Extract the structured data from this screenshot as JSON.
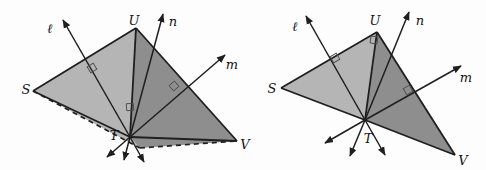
{
  "canvas": {
    "width": 486,
    "height": 170,
    "background": "#fdfdfd"
  },
  "colors": {
    "light_fill": "#b5b5b5",
    "dark_fill": "#8e8e8e",
    "stroke": "#1f1f1f",
    "label": "#131313",
    "angle_mark": "#4a4a4a"
  },
  "figures": [
    {
      "id": "left-figure",
      "vertices": {
        "S": [
          33,
          91
        ],
        "U": [
          136,
          28
        ],
        "T": [
          130,
          137
        ],
        "V": [
          237,
          141
        ],
        "P": [
          140,
          148
        ]
      },
      "light_face": [
        "S",
        "U",
        "T",
        "P"
      ],
      "dark_face": [
        "U",
        "V",
        "P",
        "T"
      ],
      "solid_edges": [
        [
          "S",
          "U"
        ],
        [
          "U",
          "V"
        ],
        [
          "U",
          "T"
        ],
        [
          "S",
          "T"
        ],
        [
          "T",
          "V"
        ]
      ],
      "dashed_edges": [
        [
          "S",
          "P"
        ],
        [
          "P",
          "V"
        ]
      ],
      "rays": [
        {
          "name": "ray-l-up",
          "from": "T",
          "to": [
            63,
            20
          ]
        },
        {
          "name": "ray-l-down",
          "from": "T",
          "to": [
            144,
            162
          ]
        },
        {
          "name": "ray-n-up",
          "from": "T",
          "to": [
            163,
            14
          ]
        },
        {
          "name": "ray-n-down",
          "from": "T",
          "to": [
            124,
            160
          ]
        },
        {
          "name": "ray-m-up",
          "from": "T",
          "to": [
            225,
            55
          ]
        },
        {
          "name": "ray-m-down",
          "from": "T",
          "to": [
            107,
            157
          ]
        }
      ],
      "right_angle_marks": [
        {
          "x": 92,
          "y": 68,
          "rotation": -31,
          "size": 7
        },
        {
          "x": 174,
          "y": 86,
          "rotation": -41,
          "size": 7
        },
        {
          "x": 130,
          "y": 107,
          "rotation": -3,
          "size": 7
        }
      ],
      "labels": [
        {
          "name": "label-line-l",
          "text": "ℓ",
          "x": 50,
          "y": 28
        },
        {
          "name": "label-vertex-U",
          "text": "U",
          "x": 134,
          "y": 20
        },
        {
          "name": "label-line-n",
          "text": "n",
          "x": 173,
          "y": 21
        },
        {
          "name": "label-line-m",
          "text": "m",
          "x": 232,
          "y": 64
        },
        {
          "name": "label-vertex-S",
          "text": "S",
          "x": 26,
          "y": 89
        },
        {
          "name": "label-vertex-T",
          "text": "T",
          "x": 114,
          "y": 135
        },
        {
          "name": "label-vertex-V",
          "text": "V",
          "x": 245,
          "y": 144
        }
      ]
    },
    {
      "id": "right-figure",
      "vertices": {
        "S": [
          281,
          88
        ],
        "U": [
          377,
          32
        ],
        "T": [
          365,
          120
        ],
        "V": [
          455,
          155
        ]
      },
      "light_face": [
        "S",
        "U",
        "T"
      ],
      "dark_face": [
        "U",
        "V",
        "T"
      ],
      "solid_edges": [
        [
          "S",
          "U"
        ],
        [
          "U",
          "V"
        ],
        [
          "U",
          "T"
        ],
        [
          "S",
          "T"
        ],
        [
          "T",
          "V"
        ]
      ],
      "dashed_edges": [],
      "rays": [
        {
          "name": "ray-l-up",
          "from": "T",
          "to": [
            306,
            16
          ]
        },
        {
          "name": "ray-l-down",
          "from": "T",
          "to": [
            385,
            155
          ]
        },
        {
          "name": "ray-n-up",
          "from": "T",
          "to": [
            409,
            12
          ]
        },
        {
          "name": "ray-n-down",
          "from": "T",
          "to": [
            350,
            156
          ]
        },
        {
          "name": "ray-m-up",
          "from": "T",
          "to": [
            461,
            66
          ]
        },
        {
          "name": "ray-m-down",
          "from": "T",
          "to": [
            325,
            143
          ]
        }
      ],
      "right_angle_marks": [
        {
          "x": 335,
          "y": 58,
          "rotation": -30,
          "size": 7
        },
        {
          "x": 374,
          "y": 40,
          "rotation": 8,
          "size": 7
        },
        {
          "x": 408,
          "y": 90,
          "rotation": -29,
          "size": 7
        }
      ],
      "labels": [
        {
          "name": "label-line-l",
          "text": "ℓ",
          "x": 295,
          "y": 26
        },
        {
          "name": "label-vertex-U",
          "text": "U",
          "x": 375,
          "y": 20
        },
        {
          "name": "label-line-n",
          "text": "n",
          "x": 420,
          "y": 20
        },
        {
          "name": "label-line-m",
          "text": "m",
          "x": 466,
          "y": 77
        },
        {
          "name": "label-vertex-S",
          "text": "S",
          "x": 272,
          "y": 88
        },
        {
          "name": "label-vertex-T",
          "text": "T",
          "x": 368,
          "y": 138
        },
        {
          "name": "label-vertex-V",
          "text": "V",
          "x": 463,
          "y": 160
        }
      ]
    }
  ]
}
